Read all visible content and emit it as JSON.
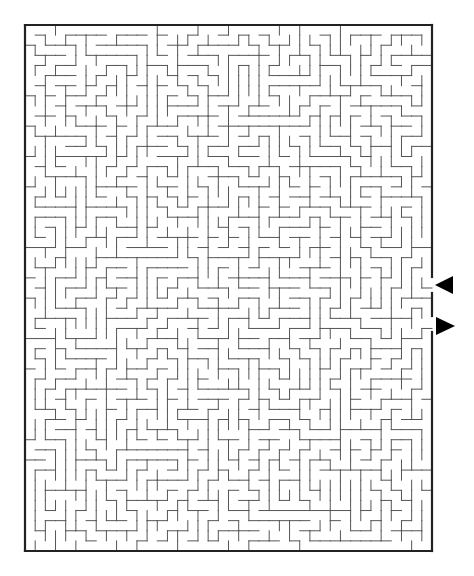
{
  "maze": {
    "left": 25,
    "top": 25,
    "right": 432,
    "bottom": 551,
    "cols": 40,
    "rows": 52,
    "seed": 1234567,
    "wall_color": "#555555",
    "border_color": "#222222",
    "wall_width": 1,
    "border_width": 2.2,
    "openings": [
      {
        "side": "right",
        "y_start": 277,
        "y_end": 293
      },
      {
        "side": "right",
        "y_start": 316,
        "y_end": 332
      }
    ]
  },
  "arrows": [
    {
      "name": "entry-arrow",
      "direction": "left",
      "tip_x": 435,
      "base_x": 453,
      "center_y": 285,
      "half_height": 9,
      "color": "#000000"
    },
    {
      "name": "exit-arrow",
      "direction": "right",
      "tip_x": 455,
      "base_x": 436,
      "center_y": 326,
      "half_height": 9,
      "color": "#000000"
    }
  ]
}
